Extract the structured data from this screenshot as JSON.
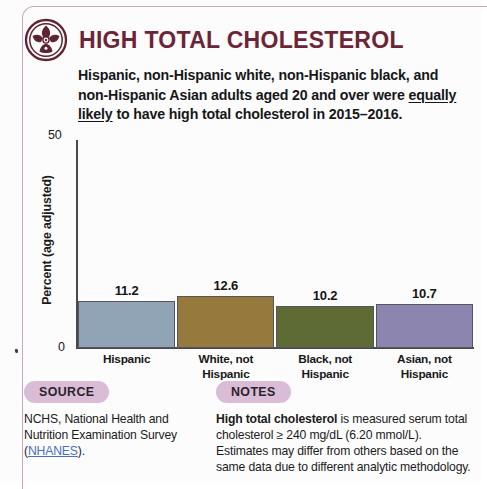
{
  "header": {
    "icon": "cholesterol-artery-icon",
    "title": "HIGH TOTAL CHOLESTEROL",
    "title_color": "#6b2537"
  },
  "subtitle": {
    "part1": "Hispanic, non-Hispanic white, non-Hispanic black, and non-Hispanic Asian adults aged 20 and over were ",
    "emphasis": "equally likely",
    "part2": " to have high total cholesterol in 2015–2016."
  },
  "chart_data": {
    "type": "bar",
    "title": "",
    "categories": [
      "Hispanic",
      "White, not Hispanic",
      "Black, not Hispanic",
      "Asian, not Hispanic"
    ],
    "category_lines": [
      [
        "Hispanic"
      ],
      [
        "White, not",
        "Hispanic"
      ],
      [
        "Black, not",
        "Hispanic"
      ],
      [
        "Asian, not",
        "Hispanic"
      ]
    ],
    "values": [
      11.2,
      12.6,
      10.2,
      10.7
    ],
    "value_labels": [
      "11.2",
      "12.6",
      "10.2",
      "10.7"
    ],
    "colors": [
      "#90a4b6",
      "#96793c",
      "#5f6b34",
      "#8c85b0"
    ],
    "xlabel": "",
    "ylabel": "Percent (age adjusted)",
    "ylim": [
      0,
      50
    ],
    "ytick_labels": [
      "0",
      "50"
    ],
    "grid": false,
    "legend": false
  },
  "footer": {
    "source": {
      "label": "SOURCE",
      "text_before": "NCHS, National Health and Nutrition Examination Survey (",
      "link": "NHANES",
      "text_after": ")."
    },
    "notes": {
      "label": "NOTES",
      "bold_lead": "High total cholesterol",
      "text": " is measured serum total cholesterol ≥ 240 mg/dL (6.20 mmol/L). Estimates may differ from others based on the same data due to different analytic methodology."
    },
    "pill_color": "#d9bdd6"
  }
}
